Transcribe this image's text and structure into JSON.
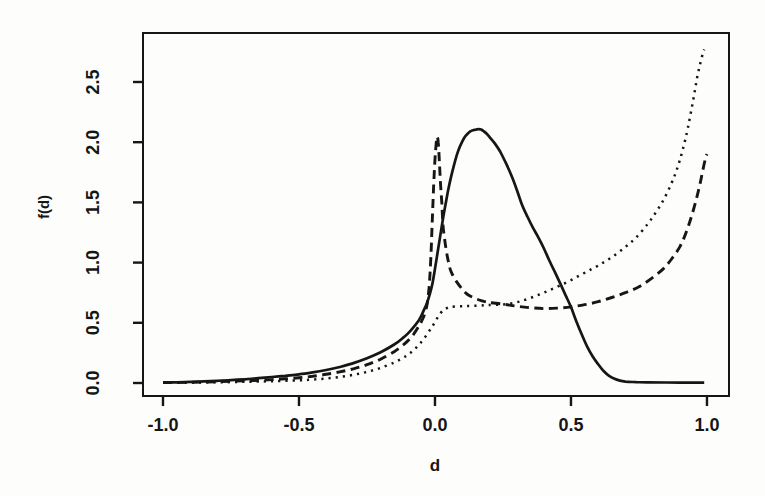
{
  "figure": {
    "background": "#fdfdfc",
    "ink": "#161616"
  },
  "chart_data": {
    "type": "line",
    "title": "",
    "xlabel": "d",
    "ylabel": "f(d)",
    "grid": false,
    "legend": "none",
    "xlim": [
      -1.0735,
      1.081
    ],
    "ylim": [
      -0.108,
      2.907
    ],
    "x_ticks": {
      "values": [
        -1.0,
        -0.5,
        0.0,
        0.5,
        1.0
      ],
      "labels": [
        "-1.0",
        "-0.5",
        "0.0",
        "0.5",
        "1.0"
      ]
    },
    "y_ticks": {
      "values": [
        0.0,
        0.5,
        1.0,
        1.5,
        2.0,
        2.5
      ],
      "labels": [
        "0.0",
        "0.5",
        "1.0",
        "1.5",
        "2.0",
        "2.5"
      ]
    },
    "series": [
      {
        "name": "solid-curve",
        "line_style": "solid",
        "points": [
          [
            -1.0,
            0.004
          ],
          [
            -0.95,
            0.006
          ],
          [
            -0.9,
            0.009
          ],
          [
            -0.85,
            0.013
          ],
          [
            -0.8,
            0.018
          ],
          [
            -0.75,
            0.024
          ],
          [
            -0.7,
            0.031
          ],
          [
            -0.65,
            0.04
          ],
          [
            -0.6,
            0.05
          ],
          [
            -0.55,
            0.06
          ],
          [
            -0.5,
            0.072
          ],
          [
            -0.45,
            0.088
          ],
          [
            -0.4,
            0.108
          ],
          [
            -0.35,
            0.133
          ],
          [
            -0.3,
            0.165
          ],
          [
            -0.25,
            0.205
          ],
          [
            -0.2,
            0.255
          ],
          [
            -0.15,
            0.32
          ],
          [
            -0.12,
            0.37
          ],
          [
            -0.1,
            0.41
          ],
          [
            -0.08,
            0.46
          ],
          [
            -0.06,
            0.52
          ],
          [
            -0.05,
            0.56
          ],
          [
            -0.04,
            0.61
          ],
          [
            -0.03,
            0.66
          ],
          [
            -0.02,
            0.73
          ],
          [
            -0.01,
            0.82
          ],
          [
            0.0,
            0.95
          ],
          [
            0.01,
            1.09
          ],
          [
            0.02,
            1.23
          ],
          [
            0.03,
            1.37
          ],
          [
            0.04,
            1.5
          ],
          [
            0.05,
            1.62
          ],
          [
            0.06,
            1.72
          ],
          [
            0.07,
            1.81
          ],
          [
            0.08,
            1.89
          ],
          [
            0.09,
            1.955
          ],
          [
            0.1,
            2.005
          ],
          [
            0.11,
            2.045
          ],
          [
            0.12,
            2.07
          ],
          [
            0.13,
            2.09
          ],
          [
            0.14,
            2.1
          ],
          [
            0.15,
            2.105
          ],
          [
            0.16,
            2.108
          ],
          [
            0.17,
            2.105
          ],
          [
            0.18,
            2.09
          ],
          [
            0.19,
            2.07
          ],
          [
            0.2,
            2.045
          ],
          [
            0.22,
            1.99
          ],
          [
            0.24,
            1.92
          ],
          [
            0.26,
            1.83
          ],
          [
            0.28,
            1.73
          ],
          [
            0.3,
            1.61
          ],
          [
            0.32,
            1.48
          ],
          [
            0.34,
            1.38
          ],
          [
            0.36,
            1.29
          ],
          [
            0.38,
            1.21
          ],
          [
            0.4,
            1.12
          ],
          [
            0.42,
            1.02
          ],
          [
            0.44,
            0.925
          ],
          [
            0.46,
            0.83
          ],
          [
            0.48,
            0.73
          ],
          [
            0.5,
            0.63
          ],
          [
            0.52,
            0.51
          ],
          [
            0.54,
            0.4
          ],
          [
            0.56,
            0.3
          ],
          [
            0.58,
            0.22
          ],
          [
            0.6,
            0.155
          ],
          [
            0.62,
            0.1
          ],
          [
            0.64,
            0.06
          ],
          [
            0.66,
            0.035
          ],
          [
            0.68,
            0.02
          ],
          [
            0.7,
            0.012
          ],
          [
            0.74,
            0.007
          ],
          [
            0.78,
            0.005
          ],
          [
            0.85,
            0.004
          ],
          [
            0.9,
            0.003
          ],
          [
            0.95,
            0.003
          ],
          [
            0.99,
            0.003
          ]
        ]
      },
      {
        "name": "dashed-curve",
        "line_style": "dashed",
        "points": [
          [
            -1.0,
            0.003
          ],
          [
            -0.9,
            0.006
          ],
          [
            -0.8,
            0.011
          ],
          [
            -0.7,
            0.018
          ],
          [
            -0.6,
            0.028
          ],
          [
            -0.55,
            0.035
          ],
          [
            -0.5,
            0.044
          ],
          [
            -0.45,
            0.056
          ],
          [
            -0.4,
            0.072
          ],
          [
            -0.35,
            0.092
          ],
          [
            -0.3,
            0.118
          ],
          [
            -0.25,
            0.152
          ],
          [
            -0.2,
            0.198
          ],
          [
            -0.15,
            0.26
          ],
          [
            -0.12,
            0.31
          ],
          [
            -0.1,
            0.35
          ],
          [
            -0.08,
            0.4
          ],
          [
            -0.06,
            0.47
          ],
          [
            -0.05,
            0.51
          ],
          [
            -0.04,
            0.56
          ],
          [
            -0.03,
            0.64
          ],
          [
            -0.025,
            0.72
          ],
          [
            -0.02,
            0.84
          ],
          [
            -0.015,
            1.05
          ],
          [
            -0.01,
            1.35
          ],
          [
            -0.005,
            1.63
          ],
          [
            0.0,
            1.86
          ],
          [
            0.005,
            2.0
          ],
          [
            0.008,
            2.045
          ],
          [
            0.012,
            2.0
          ],
          [
            0.016,
            1.85
          ],
          [
            0.02,
            1.67
          ],
          [
            0.025,
            1.5
          ],
          [
            0.03,
            1.3
          ],
          [
            0.04,
            1.12
          ],
          [
            0.05,
            1.0
          ],
          [
            0.06,
            0.92
          ],
          [
            0.08,
            0.84
          ],
          [
            0.1,
            0.78
          ],
          [
            0.12,
            0.735
          ],
          [
            0.15,
            0.7
          ],
          [
            0.18,
            0.678
          ],
          [
            0.2,
            0.668
          ],
          [
            0.25,
            0.655
          ],
          [
            0.3,
            0.638
          ],
          [
            0.35,
            0.625
          ],
          [
            0.4,
            0.618
          ],
          [
            0.45,
            0.622
          ],
          [
            0.5,
            0.632
          ],
          [
            0.55,
            0.65
          ],
          [
            0.6,
            0.675
          ],
          [
            0.65,
            0.71
          ],
          [
            0.7,
            0.75
          ],
          [
            0.75,
            0.8
          ],
          [
            0.8,
            0.875
          ],
          [
            0.84,
            0.95
          ],
          [
            0.87,
            1.03
          ],
          [
            0.9,
            1.13
          ],
          [
            0.92,
            1.23
          ],
          [
            0.94,
            1.36
          ],
          [
            0.96,
            1.52
          ],
          [
            0.975,
            1.66
          ],
          [
            0.985,
            1.77
          ],
          [
            0.995,
            1.87
          ],
          [
            1.0,
            1.9
          ]
        ]
      },
      {
        "name": "dotted-curve",
        "line_style": "dotted",
        "points": [
          [
            -1.0,
            0.002
          ],
          [
            -0.9,
            0.004
          ],
          [
            -0.8,
            0.006
          ],
          [
            -0.7,
            0.01
          ],
          [
            -0.6,
            0.015
          ],
          [
            -0.5,
            0.022
          ],
          [
            -0.45,
            0.028
          ],
          [
            -0.4,
            0.037
          ],
          [
            -0.35,
            0.05
          ],
          [
            -0.3,
            0.068
          ],
          [
            -0.25,
            0.092
          ],
          [
            -0.2,
            0.125
          ],
          [
            -0.15,
            0.17
          ],
          [
            -0.12,
            0.205
          ],
          [
            -0.1,
            0.235
          ],
          [
            -0.08,
            0.27
          ],
          [
            -0.06,
            0.315
          ],
          [
            -0.04,
            0.37
          ],
          [
            -0.02,
            0.435
          ],
          [
            -0.01,
            0.47
          ],
          [
            0.0,
            0.505
          ],
          [
            0.01,
            0.545
          ],
          [
            0.02,
            0.578
          ],
          [
            0.03,
            0.605
          ],
          [
            0.04,
            0.618
          ],
          [
            0.05,
            0.628
          ],
          [
            0.06,
            0.632
          ],
          [
            0.08,
            0.636
          ],
          [
            0.1,
            0.638
          ],
          [
            0.12,
            0.64
          ],
          [
            0.15,
            0.642
          ],
          [
            0.18,
            0.645
          ],
          [
            0.2,
            0.648
          ],
          [
            0.25,
            0.652
          ],
          [
            0.3,
            0.67
          ],
          [
            0.35,
            0.705
          ],
          [
            0.4,
            0.75
          ],
          [
            0.45,
            0.8
          ],
          [
            0.5,
            0.855
          ],
          [
            0.55,
            0.915
          ],
          [
            0.6,
            0.975
          ],
          [
            0.65,
            1.045
          ],
          [
            0.7,
            1.13
          ],
          [
            0.74,
            1.21
          ],
          [
            0.78,
            1.315
          ],
          [
            0.81,
            1.41
          ],
          [
            0.84,
            1.52
          ],
          [
            0.87,
            1.66
          ],
          [
            0.89,
            1.78
          ],
          [
            0.91,
            1.93
          ],
          [
            0.93,
            2.12
          ],
          [
            0.95,
            2.36
          ],
          [
            0.965,
            2.55
          ],
          [
            0.975,
            2.65
          ],
          [
            0.985,
            2.74
          ],
          [
            0.99,
            2.77
          ]
        ]
      }
    ]
  }
}
